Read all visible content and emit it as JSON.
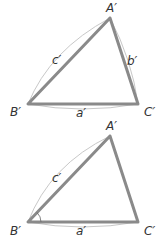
{
  "figures": [
    {
      "name": "triangle-top",
      "vertices": {
        "A": "A′",
        "B": "B′",
        "C": "C′"
      },
      "sides": {
        "a": "a′",
        "b": "b′",
        "c": "c′"
      },
      "angle_marked": false
    },
    {
      "name": "triangle-bottom",
      "vertices": {
        "A": "A′",
        "B": "B′",
        "C": "C′"
      },
      "sides": {
        "a": "a′",
        "c": "c′"
      },
      "angle_marked": true
    }
  ],
  "colors": {
    "edge": "#8a8a8a",
    "arc": "#c8c8c8",
    "label": "#333333"
  }
}
